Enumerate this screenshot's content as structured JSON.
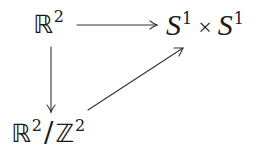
{
  "diagram": {
    "type": "commutative-diagram",
    "nodes": [
      {
        "id": "R2",
        "base": "ℝ",
        "exp": "2"
      },
      {
        "id": "S1xS1",
        "left_base": "S",
        "left_exp": "1",
        "op": "×",
        "right_base": "S",
        "right_exp": "1"
      },
      {
        "id": "R2modZ2",
        "num_base": "ℝ",
        "num_exp": "2",
        "slash": "/",
        "den_base": "ℤ",
        "den_exp": "2"
      }
    ],
    "edges": [
      {
        "from": "R2",
        "to": "S1xS1",
        "direction": "right"
      },
      {
        "from": "R2",
        "to": "R2modZ2",
        "direction": "down"
      },
      {
        "from": "R2modZ2",
        "to": "S1xS1",
        "direction": "up-right"
      }
    ],
    "colors": {
      "stroke": "#333333",
      "text": "#1a1a1a",
      "background": "#ffffff"
    }
  }
}
